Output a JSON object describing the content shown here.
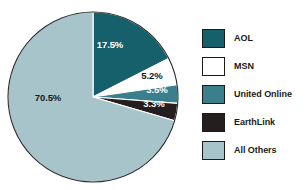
{
  "chart_data": {
    "type": "pie",
    "title": "",
    "subtitle": "",
    "xlabel": "",
    "ylabel": "",
    "grid": false,
    "legend_position": "right",
    "start_angle_deg": 0,
    "direction": "clockwise",
    "categories": [
      "AOL",
      "MSN",
      "United Online",
      "EarthLink",
      "All Others"
    ],
    "values": [
      17.5,
      5.2,
      3.5,
      3.3,
      70.5
    ],
    "value_labels": [
      "17.5%",
      "5.2%",
      "3.5%",
      "3.3%",
      "70.5%"
    ],
    "colors": [
      "#15606b",
      "#ffffff",
      "#3c7f8c",
      "#241f1e",
      "#a8c4cb"
    ],
    "label_text_colors": [
      "#ffffff",
      "#16191a",
      "#ffffff",
      "#ffffff",
      "#16191a"
    ],
    "slices": [
      {
        "name": "AOL",
        "value": 17.5,
        "label": "17.5%",
        "color": "#15606b",
        "label_color": "#ffffff",
        "label_x": 110,
        "label_y": 45
      },
      {
        "name": "MSN",
        "value": 5.2,
        "label": "5.2%",
        "color": "#ffffff",
        "label_color": "#16191a",
        "label_x": 152,
        "label_y": 76
      },
      {
        "name": "United Online",
        "value": 3.5,
        "label": "3.5%",
        "color": "#3c7f8c",
        "label_color": "#ffffff",
        "label_x": 157,
        "label_y": 90
      },
      {
        "name": "EarthLink",
        "value": 3.3,
        "label": "3.3%",
        "color": "#241f1e",
        "label_color": "#ffffff",
        "label_x": 154,
        "label_y": 104
      },
      {
        "name": "All Others",
        "value": 70.5,
        "label": "70.5%",
        "color": "#a8c4cb",
        "label_color": "#16191a",
        "label_x": 48,
        "label_y": 98
      }
    ],
    "geometry": {
      "cx": 93,
      "cy": 97,
      "r": 85,
      "outline_color": "#2b2b2b",
      "separator_color": "#ffffff"
    }
  },
  "legend": {
    "items": [
      {
        "label": "AOL",
        "color": "#15606b"
      },
      {
        "label": "MSN",
        "color": "#ffffff"
      },
      {
        "label": "United Online",
        "color": "#3c7f8c"
      },
      {
        "label": "EarthLink",
        "color": "#241f1e"
      },
      {
        "label": "All Others",
        "color": "#a8c4cb"
      }
    ]
  }
}
